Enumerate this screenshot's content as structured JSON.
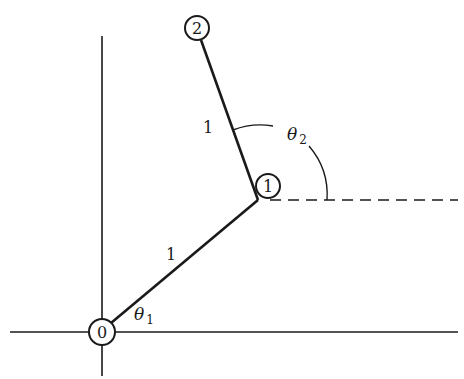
{
  "diagram": {
    "type": "two-link planar manipulator",
    "colors": {
      "ink": "#1a1a1a",
      "background": "#ffffff"
    },
    "axes": {
      "horizontal": {
        "x1": 10,
        "x2": 458,
        "y": 332
      },
      "vertical": {
        "x": 102,
        "y1": 36,
        "y2": 376
      }
    },
    "nodes": [
      {
        "id": "0",
        "label": "0",
        "cx": 102,
        "cy": 332,
        "r": 13
      },
      {
        "id": "1",
        "label": "1",
        "cx": 268,
        "cy": 186,
        "r": 12
      },
      {
        "id": "2",
        "label": "2",
        "cx": 197,
        "cy": 28,
        "r": 12
      }
    ],
    "links": [
      {
        "from": "0",
        "to": "1",
        "label": "1",
        "label_x": 171,
        "label_y": 254
      },
      {
        "from": "1",
        "to": "2",
        "label": "1",
        "label_x": 205,
        "label_y": 129
      }
    ],
    "reference_line": {
      "style": "dashed",
      "x1": 270,
      "x2": 458,
      "y": 200
    },
    "angles": [
      {
        "name": "theta-1",
        "symbol": "θ",
        "subscript": "1",
        "label_x": 135,
        "label_y": 320
      },
      {
        "name": "theta-2",
        "symbol": "θ",
        "subscript": "2",
        "label_x": 288,
        "label_y": 140
      }
    ]
  }
}
